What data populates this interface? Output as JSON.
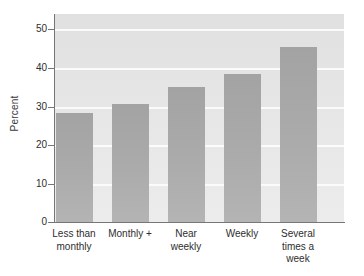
{
  "chart_data": {
    "type": "bar",
    "title": "",
    "xlabel": "",
    "ylabel": "Percent",
    "categories": [
      "Less than monthly",
      "Monthly +",
      "Near weekly",
      "Weekly",
      "Several times a week"
    ],
    "category_lines": [
      [
        "Less than",
        "monthly"
      ],
      [
        "Monthly +"
      ],
      [
        "Near",
        "weekly"
      ],
      [
        "Weekly"
      ],
      [
        "Several",
        "times a",
        "week"
      ]
    ],
    "values": [
      27.7,
      30.0,
      34.5,
      37.8,
      44.6
    ],
    "ylim": [
      0,
      53
    ],
    "yticks": [
      0,
      10,
      20,
      30,
      40,
      50
    ],
    "ytick_labels": [
      "0",
      "10",
      "20",
      "30",
      "40",
      "50"
    ],
    "grid": true,
    "legend": "none",
    "colors": {
      "bar_fill": "#a9a9a9",
      "panel_background": "#e4e4e4",
      "gridline": "#fbfbfb",
      "axis_line": "#767676",
      "text": "#2e2e2e"
    }
  }
}
